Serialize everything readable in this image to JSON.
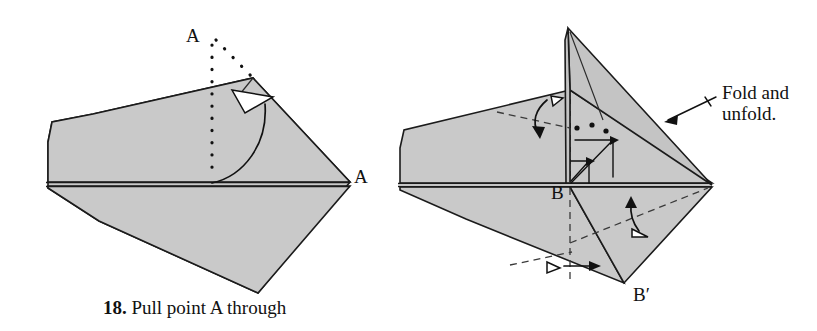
{
  "page": {
    "background_color": "#ffffff",
    "width": 817,
    "height": 331
  },
  "colors": {
    "paper_fill": "#c9c9c9",
    "outline": "#1b1b1b",
    "arrow": "#111111",
    "arrow_hollow_fill": "#ffffff",
    "text": "#111111"
  },
  "caption": {
    "number": "18.",
    "text": "Pull point A through"
  },
  "figures": [
    {
      "id": "left-figure",
      "name": "pull-point-a-step",
      "labels": [
        {
          "name": "point-label-A-top",
          "text": "A"
        },
        {
          "name": "point-label-A-right",
          "text": "A"
        }
      ],
      "markers": [
        {
          "name": "dotted-fold-line-vertical",
          "style": "dotted"
        },
        {
          "name": "dotted-fold-line-diagonal",
          "style": "dotted"
        },
        {
          "name": "pull-arrow-curved",
          "style": "curved-arc-hollow-arrowhead"
        },
        {
          "name": "center-crease-horizontal",
          "style": "solid"
        }
      ]
    },
    {
      "id": "right-figure",
      "name": "fold-and-unfold-step",
      "labels": [
        {
          "name": "point-label-B",
          "text": "B"
        },
        {
          "name": "point-label-B-prime",
          "text": "B′"
        }
      ],
      "annotation": {
        "name": "fold-and-unfold-note",
        "line1": "Fold and",
        "line2": "unfold."
      },
      "markers": [
        {
          "name": "valley-fold-dashed-vertical",
          "style": "dashed"
        },
        {
          "name": "valley-fold-dashed-upper-left",
          "style": "dashed"
        },
        {
          "name": "valley-fold-dashed-lower-right",
          "style": "dashed"
        },
        {
          "name": "valley-fold-dashed-lower-left",
          "style": "dashed"
        },
        {
          "name": "fold-unfold-arrow-upper",
          "style": "curved-arrow-hollow-triangle"
        },
        {
          "name": "fold-unfold-arrow-lower-right",
          "style": "curved-arrow-hollow-triangle"
        },
        {
          "name": "fold-unfold-arrow-lower-left",
          "style": "straight-arrow-hollow-triangle"
        },
        {
          "name": "push-arrow-inner-small",
          "style": "right-angle-arrow"
        },
        {
          "name": "push-arrow-inner-large",
          "style": "right-angle-arrow"
        },
        {
          "name": "dotted-alignment-marks",
          "style": "dots"
        },
        {
          "name": "leader-line-to-edge",
          "style": "arrow-with-tick"
        }
      ]
    }
  ]
}
